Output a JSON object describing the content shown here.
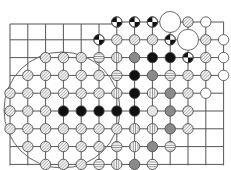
{
  "board": {
    "cols": 13,
    "rows": 9,
    "origin_x": 10,
    "origin_y": 22,
    "spacing_x": 17.8,
    "spacing_y": 17.8,
    "line_color": "#555555",
    "background": "#ffffff",
    "region_circle": {
      "cx": 62,
      "cy": 110,
      "r": 58,
      "color": "#666666"
    }
  },
  "stone_styles": {
    "black": {
      "fill": "#111111"
    },
    "gray": {
      "fill": "#8a8a8a"
    },
    "white": {
      "fill": "#ffffff"
    },
    "light": {
      "fill": "#e6e6e6"
    },
    "hatched": {
      "fill": "url(#hatch-diag)"
    },
    "horizontal": {
      "fill": "url(#hatch-horiz)"
    },
    "vertical": {
      "fill": "url(#hatch-vert)"
    },
    "split": {
      "fill": "split"
    }
  },
  "stones": [
    {
      "c": 6,
      "r": 0,
      "t": "split"
    },
    {
      "c": 7,
      "r": 0,
      "t": "split"
    },
    {
      "c": 8,
      "r": 0,
      "t": "split"
    },
    {
      "c": 9,
      "r": 0,
      "t": "white",
      "big": true
    },
    {
      "c": 10,
      "r": 0,
      "t": "hatched"
    },
    {
      "c": 11,
      "r": 0,
      "t": "white"
    },
    {
      "c": 5,
      "r": 1,
      "t": "split"
    },
    {
      "c": 6,
      "r": 1,
      "t": "hatched"
    },
    {
      "c": 7,
      "r": 1,
      "t": "hatched"
    },
    {
      "c": 8,
      "r": 1,
      "t": "hatched"
    },
    {
      "c": 9,
      "r": 1,
      "t": "split"
    },
    {
      "c": 10,
      "r": 1,
      "t": "white",
      "big": true
    },
    {
      "c": 11,
      "r": 1,
      "t": "hatched"
    },
    {
      "c": 12,
      "r": 1,
      "t": "white"
    },
    {
      "c": 2,
      "r": 2,
      "t": "hatched"
    },
    {
      "c": 3,
      "r": 2,
      "t": "hatched"
    },
    {
      "c": 4,
      "r": 2,
      "t": "hatched"
    },
    {
      "c": 5,
      "r": 2,
      "t": "horizontal"
    },
    {
      "c": 6,
      "r": 2,
      "t": "vertical"
    },
    {
      "c": 7,
      "r": 2,
      "t": "gray"
    },
    {
      "c": 8,
      "r": 2,
      "t": "black"
    },
    {
      "c": 9,
      "r": 2,
      "t": "black"
    },
    {
      "c": 10,
      "r": 2,
      "t": "split"
    },
    {
      "c": 11,
      "r": 2,
      "t": "hatched"
    },
    {
      "c": 12,
      "r": 2,
      "t": "white"
    },
    {
      "c": 1,
      "r": 3,
      "t": "hatched"
    },
    {
      "c": 2,
      "r": 3,
      "t": "hatched"
    },
    {
      "c": 3,
      "r": 3,
      "t": "hatched"
    },
    {
      "c": 4,
      "r": 3,
      "t": "hatched"
    },
    {
      "c": 5,
      "r": 3,
      "t": "hatched"
    },
    {
      "c": 6,
      "r": 3,
      "t": "horizontal"
    },
    {
      "c": 7,
      "r": 3,
      "t": "black"
    },
    {
      "c": 8,
      "r": 3,
      "t": "gray"
    },
    {
      "c": 9,
      "r": 3,
      "t": "horizontal"
    },
    {
      "c": 10,
      "r": 3,
      "t": "hatched"
    },
    {
      "c": 11,
      "r": 3,
      "t": "hatched"
    },
    {
      "c": 12,
      "r": 3,
      "t": "white"
    },
    {
      "c": 0,
      "r": 4,
      "t": "hatched"
    },
    {
      "c": 1,
      "r": 4,
      "t": "hatched"
    },
    {
      "c": 2,
      "r": 4,
      "t": "hatched"
    },
    {
      "c": 3,
      "r": 4,
      "t": "hatched"
    },
    {
      "c": 4,
      "r": 4,
      "t": "hatched"
    },
    {
      "c": 5,
      "r": 4,
      "t": "hatched"
    },
    {
      "c": 6,
      "r": 4,
      "t": "vertical"
    },
    {
      "c": 7,
      "r": 4,
      "t": "black"
    },
    {
      "c": 8,
      "r": 4,
      "t": "vertical"
    },
    {
      "c": 9,
      "r": 4,
      "t": "gray"
    },
    {
      "c": 10,
      "r": 4,
      "t": "hatched"
    },
    {
      "c": 11,
      "r": 4,
      "t": "white"
    },
    {
      "c": 0,
      "r": 5,
      "t": "hatched"
    },
    {
      "c": 1,
      "r": 5,
      "t": "hatched"
    },
    {
      "c": 2,
      "r": 5,
      "t": "hatched"
    },
    {
      "c": 3,
      "r": 5,
      "t": "black"
    },
    {
      "c": 4,
      "r": 5,
      "t": "black"
    },
    {
      "c": 5,
      "r": 5,
      "t": "black"
    },
    {
      "c": 6,
      "r": 5,
      "t": "black"
    },
    {
      "c": 7,
      "r": 5,
      "t": "black"
    },
    {
      "c": 8,
      "r": 5,
      "t": "light"
    },
    {
      "c": 9,
      "r": 5,
      "t": "gray"
    },
    {
      "c": 10,
      "r": 5,
      "t": "hatched"
    },
    {
      "c": 0,
      "r": 6,
      "t": "hatched"
    },
    {
      "c": 1,
      "r": 6,
      "t": "hatched"
    },
    {
      "c": 2,
      "r": 6,
      "t": "hatched"
    },
    {
      "c": 3,
      "r": 6,
      "t": "hatched"
    },
    {
      "c": 4,
      "r": 6,
      "t": "hatched"
    },
    {
      "c": 5,
      "r": 6,
      "t": "hatched"
    },
    {
      "c": 6,
      "r": 6,
      "t": "hatched"
    },
    {
      "c": 7,
      "r": 6,
      "t": "vertical"
    },
    {
      "c": 8,
      "r": 6,
      "t": "vertical"
    },
    {
      "c": 9,
      "r": 6,
      "t": "gray"
    },
    {
      "c": 10,
      "r": 6,
      "t": "hatched"
    },
    {
      "c": 1,
      "r": 7,
      "t": "hatched"
    },
    {
      "c": 2,
      "r": 7,
      "t": "hatched"
    },
    {
      "c": 3,
      "r": 7,
      "t": "hatched"
    },
    {
      "c": 4,
      "r": 7,
      "t": "hatched"
    },
    {
      "c": 5,
      "r": 7,
      "t": "hatched"
    },
    {
      "c": 6,
      "r": 7,
      "t": "horizontal"
    },
    {
      "c": 7,
      "r": 7,
      "t": "vertical"
    },
    {
      "c": 8,
      "r": 7,
      "t": "gray"
    },
    {
      "c": 9,
      "r": 7,
      "t": "horizontal"
    },
    {
      "c": 2,
      "r": 8,
      "t": "hatched"
    },
    {
      "c": 3,
      "r": 8,
      "t": "hatched"
    },
    {
      "c": 4,
      "r": 8,
      "t": "hatched"
    },
    {
      "c": 5,
      "r": 8,
      "t": "horizontal"
    },
    {
      "c": 6,
      "r": 8,
      "t": "vertical"
    },
    {
      "c": 7,
      "r": 8,
      "t": "gray"
    },
    {
      "c": 8,
      "r": 8,
      "t": "horizontal"
    }
  ]
}
